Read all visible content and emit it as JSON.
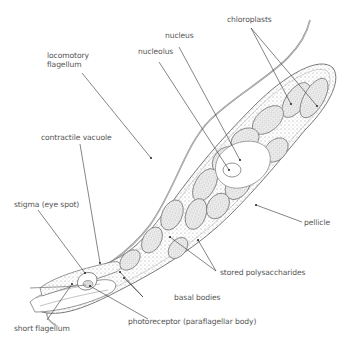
{
  "diagram": {
    "labels": {
      "locomotory_flagellum_line1": "locomotory",
      "locomotory_flagellum_line2": "flagellum",
      "nucleus": "nucleus",
      "nucleolus": "nucleolus",
      "chloroplasts": "chloroplasts",
      "contractile_vacuole": "contractile vacuole",
      "pellicle": "pellicle",
      "stigma": "stigma (eye spot)",
      "stored_polysaccharides": "stored polysaccharides",
      "basal_bodies": "basal bodies",
      "short_flagellum": "short flagellum",
      "photoreceptor": "photoreceptor (paraflagellar body)"
    },
    "colors": {
      "background": "#ffffff",
      "label_text": "#555555",
      "leader_line": "#333333",
      "outline": "#7a7a7a",
      "stipple": "#9a9a9a"
    }
  }
}
